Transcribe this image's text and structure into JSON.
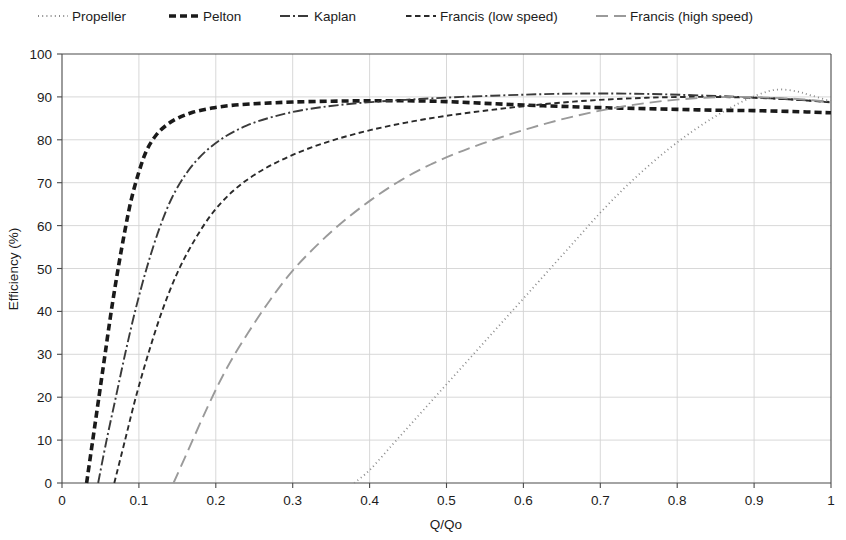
{
  "chart_data": {
    "type": "line",
    "title": "",
    "xlabel": "Q/Qo",
    "ylabel": "Efficiency (%)",
    "xlim": [
      0,
      1
    ],
    "ylim": [
      0,
      100
    ],
    "xticks": [
      "0",
      "0.1",
      "0.2",
      "0.3",
      "0.4",
      "0.5",
      "0.6",
      "0.7",
      "0.8",
      "0.9",
      "1"
    ],
    "yticks": [
      "0",
      "10",
      "20",
      "30",
      "40",
      "50",
      "60",
      "70",
      "80",
      "90",
      "100"
    ],
    "grid": true,
    "legend_position": "top",
    "series": [
      {
        "name": "Propeller",
        "style": "dotted",
        "color": "#8a8a8a",
        "width": 1.8,
        "dash": "1,3.2",
        "points": [
          [
            0.38,
            0
          ],
          [
            0.4,
            3
          ],
          [
            0.43,
            9
          ],
          [
            0.46,
            15
          ],
          [
            0.49,
            21
          ],
          [
            0.52,
            27
          ],
          [
            0.55,
            33
          ],
          [
            0.58,
            39
          ],
          [
            0.61,
            45
          ],
          [
            0.64,
            51
          ],
          [
            0.67,
            57
          ],
          [
            0.7,
            63
          ],
          [
            0.73,
            68.5
          ],
          [
            0.76,
            73.5
          ],
          [
            0.79,
            78
          ],
          [
            0.82,
            82
          ],
          [
            0.85,
            85.5
          ],
          [
            0.88,
            88.5
          ],
          [
            0.905,
            90.5
          ],
          [
            0.93,
            91.7
          ],
          [
            0.955,
            91.3
          ],
          [
            0.975,
            90.3
          ],
          [
            1.0,
            89.0
          ]
        ]
      },
      {
        "name": "Pelton",
        "style": "thick-dashed",
        "color": "#1a1a1a",
        "width": 3.6,
        "dash": "7,4",
        "points": [
          [
            0.032,
            0
          ],
          [
            0.04,
            10
          ],
          [
            0.048,
            20
          ],
          [
            0.056,
            30
          ],
          [
            0.064,
            40
          ],
          [
            0.073,
            50
          ],
          [
            0.082,
            59
          ],
          [
            0.09,
            66
          ],
          [
            0.1,
            72.5
          ],
          [
            0.11,
            77.5
          ],
          [
            0.122,
            81
          ],
          [
            0.135,
            83.3
          ],
          [
            0.15,
            85
          ],
          [
            0.17,
            86.4
          ],
          [
            0.195,
            87.4
          ],
          [
            0.225,
            88.1
          ],
          [
            0.26,
            88.5
          ],
          [
            0.3,
            88.8
          ],
          [
            0.35,
            89.0
          ],
          [
            0.4,
            89.1
          ],
          [
            0.45,
            89.1
          ],
          [
            0.5,
            88.9
          ],
          [
            0.55,
            88.5
          ],
          [
            0.6,
            88.1
          ],
          [
            0.65,
            87.8
          ],
          [
            0.7,
            87.5
          ],
          [
            0.75,
            87.3
          ],
          [
            0.8,
            87.1
          ],
          [
            0.85,
            86.9
          ],
          [
            0.9,
            86.8
          ],
          [
            0.95,
            86.6
          ],
          [
            1.0,
            86.3
          ]
        ]
      },
      {
        "name": "Kaplan",
        "style": "dash-dot",
        "color": "#3a3a3a",
        "width": 1.9,
        "dash": "10,3,2,3",
        "points": [
          [
            0.047,
            0
          ],
          [
            0.058,
            10
          ],
          [
            0.07,
            20
          ],
          [
            0.082,
            30
          ],
          [
            0.095,
            40
          ],
          [
            0.11,
            50
          ],
          [
            0.126,
            59
          ],
          [
            0.143,
            66.5
          ],
          [
            0.163,
            72.5
          ],
          [
            0.185,
            77.0
          ],
          [
            0.21,
            80.5
          ],
          [
            0.24,
            83.3
          ],
          [
            0.275,
            85.4
          ],
          [
            0.315,
            87.0
          ],
          [
            0.36,
            88.1
          ],
          [
            0.41,
            88.9
          ],
          [
            0.465,
            89.5
          ],
          [
            0.52,
            90.0
          ],
          [
            0.58,
            90.4
          ],
          [
            0.64,
            90.7
          ],
          [
            0.7,
            90.8
          ],
          [
            0.76,
            90.7
          ],
          [
            0.82,
            90.4
          ],
          [
            0.88,
            90.0
          ],
          [
            0.94,
            89.5
          ],
          [
            1.0,
            88.8
          ]
        ]
      },
      {
        "name": "Francis (low speed)",
        "style": "dashed",
        "color": "#2a2a2a",
        "width": 1.9,
        "dash": "5.5,3.5",
        "points": [
          [
            0.068,
            0
          ],
          [
            0.082,
            10
          ],
          [
            0.096,
            20
          ],
          [
            0.112,
            30
          ],
          [
            0.13,
            40
          ],
          [
            0.15,
            49
          ],
          [
            0.172,
            56.5
          ],
          [
            0.196,
            63
          ],
          [
            0.222,
            68
          ],
          [
            0.25,
            71.8
          ],
          [
            0.282,
            75.0
          ],
          [
            0.318,
            77.8
          ],
          [
            0.358,
            80.2
          ],
          [
            0.402,
            82.3
          ],
          [
            0.45,
            84.1
          ],
          [
            0.5,
            85.6
          ],
          [
            0.555,
            86.9
          ],
          [
            0.61,
            88.0
          ],
          [
            0.665,
            88.9
          ],
          [
            0.72,
            89.5
          ],
          [
            0.78,
            89.9
          ],
          [
            0.84,
            90.0
          ],
          [
            0.9,
            89.8
          ],
          [
            0.95,
            89.4
          ],
          [
            1.0,
            88.7
          ]
        ]
      },
      {
        "name": "Francis (high speed)",
        "style": "long-dashed",
        "color": "#9a9a9a",
        "width": 1.9,
        "dash": "12,6",
        "points": [
          [
            0.145,
            0
          ],
          [
            0.165,
            8
          ],
          [
            0.19,
            18
          ],
          [
            0.215,
            27
          ],
          [
            0.242,
            35
          ],
          [
            0.27,
            42.5
          ],
          [
            0.3,
            49.5
          ],
          [
            0.332,
            55.5
          ],
          [
            0.366,
            61
          ],
          [
            0.402,
            66
          ],
          [
            0.44,
            70.5
          ],
          [
            0.48,
            74.3
          ],
          [
            0.522,
            77.5
          ],
          [
            0.566,
            80.3
          ],
          [
            0.61,
            82.8
          ],
          [
            0.655,
            85.0
          ],
          [
            0.7,
            86.8
          ],
          [
            0.745,
            88.2
          ],
          [
            0.79,
            89.2
          ],
          [
            0.835,
            89.8
          ],
          [
            0.88,
            90.0
          ],
          [
            0.925,
            89.8
          ],
          [
            0.965,
            89.4
          ],
          [
            1.0,
            88.8
          ]
        ]
      }
    ]
  },
  "legend": {
    "items": [
      {
        "label": "Propeller"
      },
      {
        "label": "Pelton"
      },
      {
        "label": "Kaplan"
      },
      {
        "label": "Francis (low speed)"
      },
      {
        "label": "Francis (high speed)"
      }
    ]
  },
  "colors": {
    "background": "#ffffff",
    "grid": "#d4d4d4",
    "axis": "#4a4a4a",
    "text": "#1c1c1c"
  }
}
